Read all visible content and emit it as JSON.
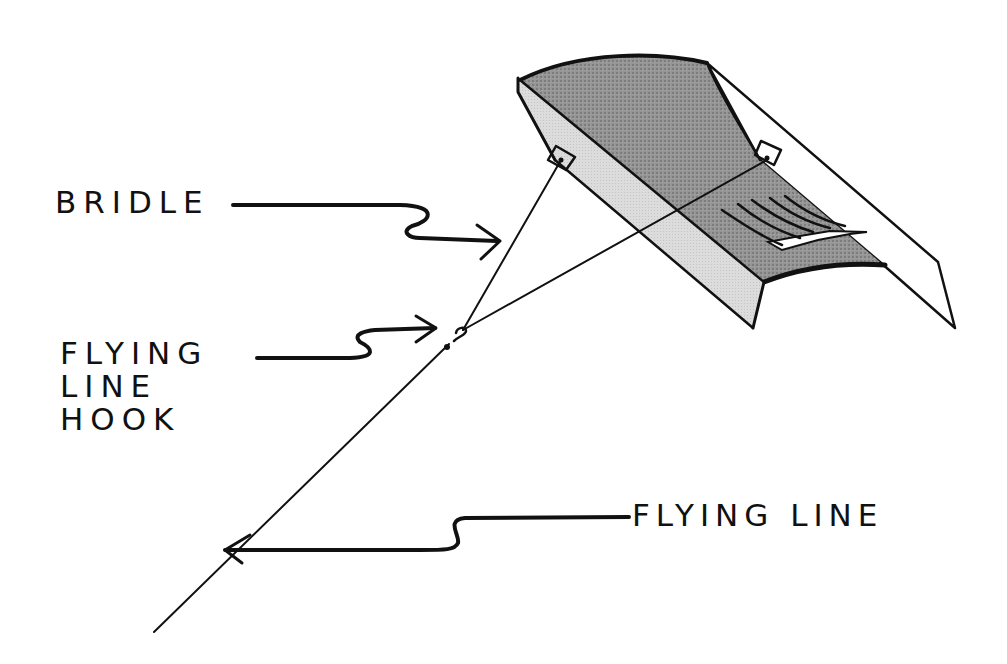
{
  "diagram": {
    "colors": {
      "ink": "#111111",
      "background": "#ffffff",
      "dark_panel": "#8f8f8f",
      "light_panel": "#d6d6d6"
    },
    "labels": {
      "bridle": "BRIDLE",
      "hook": {
        "line1": "FLYING",
        "line2": "LINE",
        "line3": "HOOK"
      },
      "flying_line": "FLYING LINE"
    }
  }
}
